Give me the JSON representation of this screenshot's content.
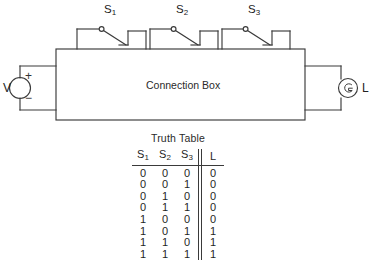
{
  "figure": {
    "box_label": "Connection Box",
    "source_label": "V",
    "source_plus": "+",
    "source_minus": "−",
    "lamp_label": "L",
    "switches": [
      {
        "name": "S",
        "sub": "1"
      },
      {
        "name": "S",
        "sub": "2"
      },
      {
        "name": "S",
        "sub": "3"
      }
    ],
    "colors": {
      "line": "#3a3a3a",
      "text": "#1f1f1f",
      "background": "#ffffff"
    }
  },
  "truth_table": {
    "title": "Truth Table",
    "headers": [
      "S₁",
      "S₂",
      "S₃",
      "L"
    ],
    "header_parts": [
      {
        "name": "S",
        "sub": "1"
      },
      {
        "name": "S",
        "sub": "2"
      },
      {
        "name": "S",
        "sub": "3"
      },
      {
        "name": "L",
        "sub": ""
      }
    ],
    "rows": [
      {
        "s1": "0",
        "s2": "0",
        "s3": "0",
        "l": "0"
      },
      {
        "s1": "0",
        "s2": "0",
        "s3": "1",
        "l": "0"
      },
      {
        "s1": "0",
        "s2": "1",
        "s3": "0",
        "l": "0"
      },
      {
        "s1": "0",
        "s2": "1",
        "s3": "1",
        "l": "0"
      },
      {
        "s1": "1",
        "s2": "0",
        "s3": "0",
        "l": "0"
      },
      {
        "s1": "1",
        "s2": "0",
        "s3": "1",
        "l": "1"
      },
      {
        "s1": "1",
        "s2": "1",
        "s3": "0",
        "l": "1"
      },
      {
        "s1": "1",
        "s2": "1",
        "s3": "1",
        "l": "1"
      }
    ]
  }
}
